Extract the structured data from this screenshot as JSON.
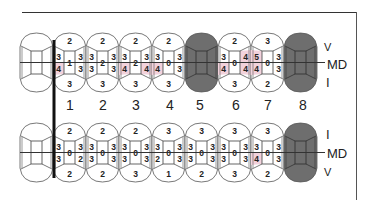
{
  "colors": {
    "missing": "#6e6e6e",
    "highlight": "#f2d2dc",
    "line": "#333333",
    "outline": "#555555"
  },
  "upper_labels": {
    "top": "V",
    "middle": "MD",
    "bottom": "I"
  },
  "lower_labels": {
    "top": "I",
    "middle": "MD",
    "bottom": "V"
  },
  "tooth_numbers": [
    "1",
    "2",
    "3",
    "4",
    "5",
    "6",
    "7",
    "8"
  ],
  "upper_row": [
    {
      "number": "",
      "blank": true
    },
    {
      "number": "1",
      "top": "2",
      "mesial_top": "3",
      "mesial_bottom": "4",
      "center": "1",
      "distal_top": "3",
      "distal_bottom": "3",
      "bottom": "3",
      "highlight": [
        "mesial_bottom"
      ]
    },
    {
      "number": "2",
      "top": "2",
      "mesial_top": "3",
      "mesial_bottom": "3",
      "center": "2",
      "distal_top": "3",
      "distal_bottom": "3",
      "bottom": "3",
      "highlight": []
    },
    {
      "number": "3",
      "top": "2",
      "mesial_top": "3",
      "mesial_bottom": "4",
      "center": "2",
      "distal_top": "3",
      "distal_bottom": "4",
      "bottom": "3",
      "highlight": [
        "mesial_bottom",
        "distal_bottom"
      ]
    },
    {
      "number": "4",
      "top": "2",
      "mesial_top": "3",
      "mesial_bottom": "4",
      "center": "0",
      "distal_top": "3",
      "distal_bottom": "3",
      "bottom": "3",
      "highlight": [
        "mesial_bottom"
      ]
    },
    {
      "number": "5",
      "missing": true
    },
    {
      "number": "6",
      "top": "2",
      "mesial_top": "3",
      "mesial_bottom": "4",
      "center": "0",
      "distal_top": "4",
      "distal_bottom": "4",
      "bottom": "3",
      "highlight": [
        "mesial_bottom",
        "distal_top",
        "distal_bottom"
      ]
    },
    {
      "number": "7",
      "top": "3",
      "mesial_top": "5",
      "mesial_bottom": "4",
      "center": "0",
      "distal_top": "3",
      "distal_bottom": "3",
      "bottom": "2",
      "highlight": [
        "mesial_top",
        "mesial_bottom"
      ]
    },
    {
      "number": "8",
      "missing": true
    }
  ],
  "lower_row": [
    {
      "number": "",
      "blank": true
    },
    {
      "number": "1",
      "top": "2",
      "mesial_top": "3",
      "mesial_bottom": "3",
      "center": "0",
      "distal_top": "3",
      "distal_bottom": "2",
      "bottom": "2",
      "highlight": []
    },
    {
      "number": "2",
      "top": "2",
      "mesial_top": "3",
      "mesial_bottom": "3",
      "center": "0",
      "distal_top": "3",
      "distal_bottom": "3",
      "bottom": "2",
      "highlight": []
    },
    {
      "number": "3",
      "top": "2",
      "mesial_top": "3",
      "mesial_bottom": "3",
      "center": "0",
      "distal_top": "3",
      "distal_bottom": "3",
      "bottom": "3",
      "highlight": []
    },
    {
      "number": "4",
      "top": "3",
      "mesial_top": "3",
      "mesial_bottom": "2",
      "center": "0",
      "distal_top": "3",
      "distal_bottom": "3",
      "bottom": "1",
      "highlight": []
    },
    {
      "number": "5",
      "top": "3",
      "mesial_top": "3",
      "mesial_bottom": "3",
      "center": "0",
      "distal_top": "3",
      "distal_bottom": "3",
      "bottom": "2",
      "highlight": []
    },
    {
      "number": "6",
      "top": "3",
      "mesial_top": "3",
      "mesial_bottom": "3",
      "center": "0",
      "distal_top": "3",
      "distal_bottom": "3",
      "bottom": "3",
      "highlight": []
    },
    {
      "number": "7",
      "top": "3",
      "mesial_top": "3",
      "mesial_bottom": "4",
      "center": "0",
      "distal_top": "3",
      "distal_bottom": "3",
      "bottom": "2",
      "highlight": [
        "mesial_bottom"
      ]
    },
    {
      "number": "8",
      "missing": true
    }
  ]
}
